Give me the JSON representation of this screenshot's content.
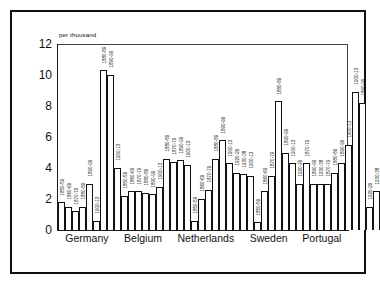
{
  "chart_data": {
    "type": "bar",
    "title": "",
    "subtitle": "",
    "units_label": "per thousand",
    "xlabel": "",
    "ylabel": "",
    "ylim": [
      0,
      12
    ],
    "yticks": [
      "0",
      "2",
      "4",
      "6",
      "8",
      "10",
      "12"
    ],
    "grid": false,
    "legend": false,
    "categories": [
      "Germany",
      "Belgium",
      "Netherlands",
      "Sweden",
      "Portugal"
    ],
    "series_note": "Each bar is one decade period; bar labels are rotated period names.",
    "groups": [
      {
        "category": "Germany",
        "bars": [
          {
            "label": "1850-59",
            "value": 1.8
          },
          {
            "label": "1860-69",
            "value": 1.5
          },
          {
            "label": "1870-79",
            "value": 1.2
          },
          {
            "label": "1880-89",
            "value": 1.5
          },
          {
            "label": "1890-99",
            "value": 3.0
          },
          {
            "label": "1900-13",
            "value": 0.6
          },
          {
            "label": "1880-89",
            "value": 10.3
          },
          {
            "label": "1890-99",
            "value": 10.0
          },
          {
            "label": "1900-13",
            "value": 4.0
          }
        ]
      },
      {
        "category": "Belgium",
        "bars": [
          {
            "label": "1850-59",
            "value": 2.2
          },
          {
            "label": "1860-69",
            "value": 2.5
          },
          {
            "label": "1870-79",
            "value": 2.5
          },
          {
            "label": "1880-89",
            "value": 2.4
          },
          {
            "label": "1890-99",
            "value": 2.3
          },
          {
            "label": "1900-13",
            "value": 2.8
          },
          {
            "label": "1880-89",
            "value": 4.6
          },
          {
            "label": "1870-79",
            "value": 4.4
          },
          {
            "label": "1890-99",
            "value": 4.5
          },
          {
            "label": "1900-13",
            "value": 4.2
          }
        ]
      },
      {
        "category": "Netherlands",
        "bars": [
          {
            "label": "1850-59",
            "value": 0.6
          },
          {
            "label": "1860-69",
            "value": 2.0
          },
          {
            "label": "1870-79",
            "value": 2.6
          },
          {
            "label": "1880-89",
            "value": 4.6
          },
          {
            "label": "1890-99",
            "value": 5.8
          },
          {
            "label": "1900-13",
            "value": 4.3
          },
          {
            "label": "1920-29",
            "value": 3.7
          },
          {
            "label": "1930-38",
            "value": 3.6
          },
          {
            "label": "1900-13",
            "value": 3.5
          }
        ]
      },
      {
        "category": "Sweden",
        "bars": [
          {
            "label": "1850-59",
            "value": 0.5
          },
          {
            "label": "1860-69",
            "value": 2.5
          },
          {
            "label": "1870-79",
            "value": 3.5
          },
          {
            "label": "1880-89",
            "value": 8.3
          },
          {
            "label": "1890-99",
            "value": 5.0
          },
          {
            "label": "1900-13",
            "value": 4.3
          },
          {
            "label": "1920-29",
            "value": 3.0
          },
          {
            "label": "1870-79",
            "value": 4.3
          },
          {
            "label": "1890-99",
            "value": 3.0
          },
          {
            "label": "1930-38",
            "value": 3.0
          }
        ]
      },
      {
        "category": "Portugal",
        "bars": [
          {
            "label": "1870-79",
            "value": 3.0
          },
          {
            "label": "1880-89",
            "value": 3.7
          },
          {
            "label": "1890-99",
            "value": 4.3
          },
          {
            "label": "1900-13",
            "value": 5.5
          },
          {
            "label": "1900-13",
            "value": 8.9
          },
          {
            "label": "1890-99",
            "value": 8.2
          },
          {
            "label": "1920-29",
            "value": 1.5
          },
          {
            "label": "1930-38",
            "value": 2.5
          }
        ]
      }
    ]
  },
  "colors": {
    "bar_fill": "#ffffff",
    "bar_stroke": "#111111",
    "axis": "#1a1a1a",
    "frame": "#101010",
    "text": "#111111",
    "background": "#ffffff"
  }
}
